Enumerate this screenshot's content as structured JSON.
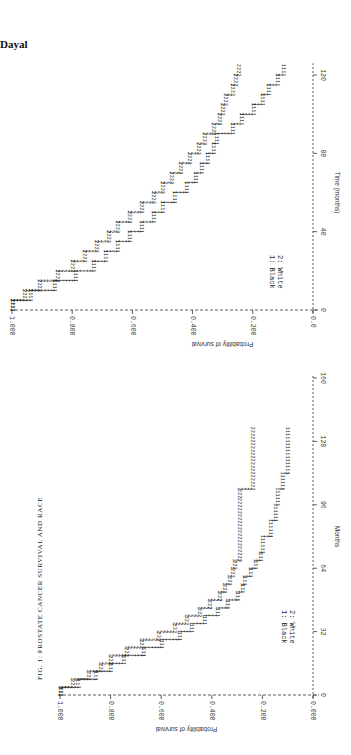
{
  "page": {
    "author": "Dayal"
  },
  "chart_data": [
    {
      "type": "line",
      "subtype": "kaplan-meier step",
      "title": "FIG. 1: PROSTATE CANCER SURVIVAL AND RACE",
      "xlabel": "Months",
      "ylabel": "Probability of survival",
      "xlim": [
        0,
        160
      ],
      "ylim": [
        0,
        1
      ],
      "x_ticks": [
        "0",
        "32",
        "64",
        "96",
        "128",
        "160"
      ],
      "y_ticks": [
        "0.000",
        "0.200",
        "0.400",
        "0.600",
        "0.800",
        "1.000"
      ],
      "legend": [
        "1: Black",
        "2: White"
      ],
      "orientation": "rotated 90° (printed sideways)",
      "series": [
        {
          "name": "1: Black",
          "marker": "1",
          "x": [
            0,
            4,
            8,
            12,
            16,
            20,
            24,
            28,
            32,
            36,
            40,
            44,
            48,
            52,
            56,
            60,
            64,
            68,
            72,
            80,
            88,
            96,
            104,
            112,
            136
          ],
          "y": [
            1.0,
            0.93,
            0.86,
            0.8,
            0.75,
            0.67,
            0.6,
            0.53,
            0.48,
            0.43,
            0.38,
            0.34,
            0.3,
            0.28,
            0.27,
            0.25,
            0.23,
            0.21,
            0.2,
            0.17,
            0.15,
            0.14,
            0.12,
            0.1,
            0.1
          ]
        },
        {
          "name": "2: White",
          "marker": "2",
          "x": [
            0,
            4,
            8,
            12,
            16,
            20,
            24,
            28,
            32,
            36,
            40,
            44,
            48,
            52,
            56,
            60,
            64,
            68,
            100,
            104,
            135
          ],
          "y": [
            1.0,
            0.95,
            0.89,
            0.84,
            0.8,
            0.74,
            0.68,
            0.61,
            0.55,
            0.5,
            0.45,
            0.41,
            0.37,
            0.35,
            0.33,
            0.32,
            0.31,
            0.29,
            0.29,
            0.24,
            0.24
          ]
        }
      ]
    },
    {
      "type": "line",
      "subtype": "kaplan-meier step",
      "title": "",
      "xlabel": "Time (months)",
      "ylabel": "Probability of survival",
      "xlim": [
        0,
        125
      ],
      "ylim": [
        0,
        1
      ],
      "x_ticks": [
        "0",
        "40",
        "80",
        "120"
      ],
      "y_ticks": [
        "0.0",
        "0.200",
        "0.400",
        "0.600",
        "0.800",
        "1.000"
      ],
      "legend": [
        "1: Black",
        "2: White"
      ],
      "orientation": "rotated 90° (printed sideways)",
      "series": [
        {
          "name": "1: Black",
          "marker": "1",
          "x": [
            0,
            5,
            10,
            15,
            20,
            25,
            30,
            35,
            40,
            45,
            50,
            55,
            60,
            65,
            70,
            75,
            80,
            85,
            90,
            95,
            100,
            105,
            110,
            115,
            120,
            125
          ],
          "y": [
            1.0,
            0.94,
            0.86,
            0.79,
            0.73,
            0.69,
            0.65,
            0.61,
            0.57,
            0.53,
            0.5,
            0.46,
            0.42,
            0.39,
            0.37,
            0.35,
            0.33,
            0.32,
            0.27,
            0.24,
            0.2,
            0.17,
            0.15,
            0.12,
            0.1,
            0.1
          ]
        },
        {
          "name": "2: White",
          "marker": "2",
          "x": [
            0,
            5,
            10,
            15,
            20,
            25,
            30,
            35,
            40,
            45,
            50,
            55,
            60,
            65,
            70,
            75,
            80,
            85,
            90,
            95,
            100,
            105,
            110,
            115,
            120,
            125
          ],
          "y": [
            1.0,
            0.96,
            0.91,
            0.85,
            0.8,
            0.76,
            0.72,
            0.68,
            0.65,
            0.61,
            0.57,
            0.53,
            0.5,
            0.47,
            0.44,
            0.41,
            0.38,
            0.36,
            0.33,
            0.31,
            0.3,
            0.29,
            0.27,
            0.26,
            0.25,
            0.25
          ]
        }
      ]
    }
  ]
}
